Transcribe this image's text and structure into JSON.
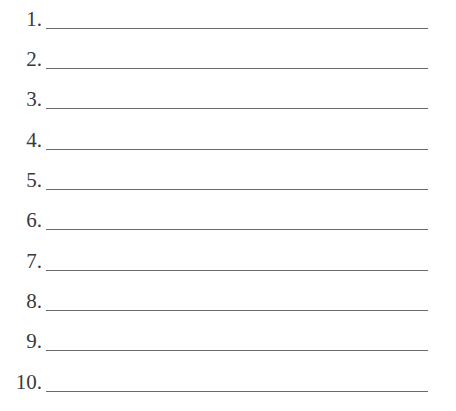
{
  "items": [
    {
      "number": "1.",
      "value": ""
    },
    {
      "number": "2.",
      "value": ""
    },
    {
      "number": "3.",
      "value": ""
    },
    {
      "number": "4.",
      "value": ""
    },
    {
      "number": "5.",
      "value": ""
    },
    {
      "number": "6.",
      "value": ""
    },
    {
      "number": "7.",
      "value": ""
    },
    {
      "number": "8.",
      "value": ""
    },
    {
      "number": "9.",
      "value": ""
    },
    {
      "number": "10.",
      "value": ""
    }
  ]
}
